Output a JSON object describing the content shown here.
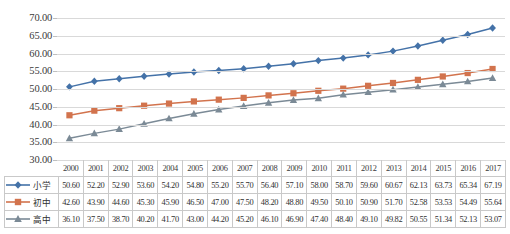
{
  "chart_data": {
    "type": "line",
    "title": "",
    "xlabel": "",
    "ylabel": "",
    "ylim": [
      30.0,
      70.0
    ],
    "ytick_step": 5.0,
    "yticks": [
      "30.00",
      "35.00",
      "40.00",
      "45.00",
      "50.00",
      "55.00",
      "60.00",
      "65.00",
      "70.00"
    ],
    "grid": true,
    "legend_position": "table-row-headers",
    "categories": [
      "2000",
      "2001",
      "2002",
      "2003",
      "2004",
      "2005",
      "2006",
      "2007",
      "2008",
      "2009",
      "2010",
      "2011",
      "2012",
      "2013",
      "2014",
      "2015",
      "2016",
      "2017"
    ],
    "series": [
      {
        "name": "小学",
        "color": "#4472a8",
        "marker": "diamond",
        "values": [
          50.6,
          52.2,
          52.9,
          53.6,
          54.2,
          54.8,
          55.2,
          55.7,
          56.4,
          57.1,
          58.0,
          58.7,
          59.6,
          60.67,
          62.13,
          63.73,
          65.34,
          67.19
        ],
        "labels": [
          "50.60",
          "52.20",
          "52.90",
          "53.60",
          "54.20",
          "54.80",
          "55.20",
          "55.70",
          "56.40",
          "57.10",
          "58.00",
          "58.70",
          "59.60",
          "60.67",
          "62.13",
          "63.73",
          "65.34",
          "67.19"
        ]
      },
      {
        "name": "初中",
        "color": "#d2734d",
        "marker": "square",
        "values": [
          42.6,
          43.9,
          44.6,
          45.3,
          45.9,
          46.5,
          47.0,
          47.5,
          48.2,
          48.8,
          49.5,
          50.1,
          50.9,
          51.7,
          52.58,
          53.53,
          54.49,
          55.64
        ],
        "labels": [
          "42.60",
          "43.90",
          "44.60",
          "45.30",
          "45.90",
          "46.50",
          "47.00",
          "47.50",
          "48.20",
          "48.80",
          "49.50",
          "50.10",
          "50.90",
          "51.70",
          "52.58",
          "53.53",
          "54.49",
          "55.64"
        ]
      },
      {
        "name": "高中",
        "color": "#7b8a96",
        "marker": "triangle",
        "values": [
          36.1,
          37.5,
          38.7,
          40.2,
          41.7,
          43.0,
          44.2,
          45.2,
          46.1,
          46.9,
          47.4,
          48.4,
          49.1,
          49.82,
          50.55,
          51.34,
          52.13,
          53.07
        ],
        "labels": [
          "36.10",
          "37.50",
          "38.70",
          "40.20",
          "41.70",
          "43.00",
          "44.20",
          "45.20",
          "46.10",
          "46.90",
          "47.40",
          "48.40",
          "49.10",
          "49.82",
          "50.55",
          "51.34",
          "52.13",
          "53.07"
        ]
      }
    ]
  },
  "table": {
    "corner_label": "",
    "year_header": [
      "2000",
      "2001",
      "2002",
      "2003",
      "2004",
      "2005",
      "2006",
      "2007",
      "2008",
      "2009",
      "2010",
      "2011",
      "2012",
      "2013",
      "2014",
      "2015",
      "2016",
      "2017"
    ],
    "rows": [
      {
        "label": "小学",
        "marker": "diamond",
        "color": "#4472a8",
        "values": [
          "50.60",
          "52.20",
          "52.90",
          "53.60",
          "54.20",
          "54.80",
          "55.20",
          "55.70",
          "56.40",
          "57.10",
          "58.00",
          "58.70",
          "59.60",
          "60.67",
          "62.13",
          "63.73",
          "65.34",
          "67.19"
        ]
      },
      {
        "label": "初中",
        "marker": "square",
        "color": "#d2734d",
        "values": [
          "42.60",
          "43.90",
          "44.60",
          "45.30",
          "45.90",
          "46.50",
          "47.00",
          "47.50",
          "48.20",
          "48.80",
          "49.50",
          "50.10",
          "50.90",
          "51.70",
          "52.58",
          "53.53",
          "54.49",
          "55.64"
        ]
      },
      {
        "label": "高中",
        "marker": "triangle",
        "color": "#7b8a96",
        "values": [
          "36.10",
          "37.50",
          "38.70",
          "40.20",
          "41.70",
          "43.00",
          "44.20",
          "45.20",
          "46.10",
          "46.90",
          "47.40",
          "48.40",
          "49.10",
          "49.82",
          "50.55",
          "51.34",
          "52.13",
          "53.07"
        ]
      }
    ]
  },
  "colors": {
    "gridline": "#d9d9d9",
    "table_border": "#c9c9c9",
    "text": "#2f2f2f",
    "series_primary": "#4472a8",
    "series_junior": "#d2734d",
    "series_senior": "#7b8a96"
  }
}
